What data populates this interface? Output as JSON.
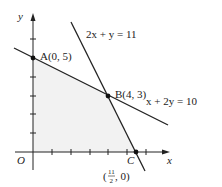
{
  "diagram": {
    "type": "linear-programming-feasible-region",
    "axes": {
      "x_label": "x",
      "y_label": "y",
      "origin_label": "O"
    },
    "lines": [
      {
        "id": "line1",
        "equation": "2x + y = 11"
      },
      {
        "id": "line2",
        "equation": "x + 2y = 10"
      }
    ],
    "points": [
      {
        "id": "A",
        "label": "A(0, 5)",
        "x": 0,
        "y": 5
      },
      {
        "id": "B",
        "label": "B(4, 3)",
        "x": 4,
        "y": 3
      },
      {
        "id": "C",
        "label": "C",
        "x": 5.5,
        "y": 0,
        "coord_label": "(11/2, 0)"
      },
      {
        "id": "O",
        "label": "O",
        "x": 0,
        "y": 0
      }
    ],
    "c_coord": {
      "open": "(",
      "num": "11",
      "den": "2",
      "rest": ", 0)"
    },
    "region_fill": "#f2f2f2",
    "line_color": "#222222"
  }
}
